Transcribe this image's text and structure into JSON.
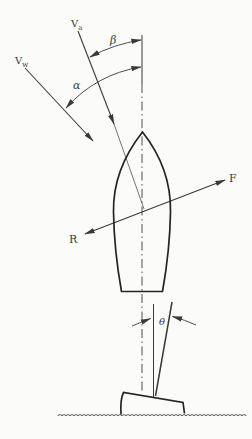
{
  "figure": {
    "type": "vector-diagram",
    "labels": {
      "apparent_wind_main": "V",
      "apparent_wind_sub": "a",
      "true_wind_main": "V",
      "true_wind_sub": "w",
      "apparent_wind_angle": "β",
      "true_wind_angle": "α",
      "driving_force": "F",
      "resistance_force": "R",
      "heel_angle": "θ"
    },
    "colors": {
      "ink": "#3a3a3a",
      "hull": "#242424",
      "background": "#fbfbfa"
    }
  }
}
